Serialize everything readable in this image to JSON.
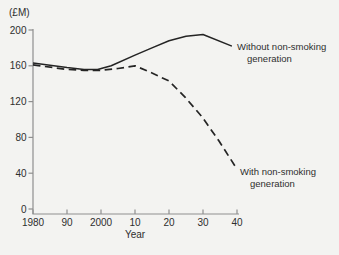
{
  "figure": {
    "background_color": "#f3f3f1",
    "axis_color": "#8f8f8f",
    "text_color": "#2e2e2e"
  },
  "chart_data": {
    "type": "line",
    "title": "",
    "ylabel": "(£M)",
    "xlabel": "Year",
    "grid": false,
    "legend": "inline-labels-at-line-ends",
    "x_axis": {
      "tick_labels": [
        "1980",
        "90",
        "2000",
        "10",
        "20",
        "30",
        "40"
      ],
      "tick_years": [
        1980,
        1990,
        2000,
        2010,
        2020,
        2030,
        2040
      ],
      "range_years": [
        1980,
        2040
      ]
    },
    "y_axis": {
      "ticks": [
        0,
        40,
        80,
        120,
        160,
        200
      ],
      "tick_labels": [
        "0",
        "40",
        "80",
        "120",
        "160",
        "200"
      ],
      "range": [
        0,
        200
      ]
    },
    "series": [
      {
        "name": "Without non-smoking generation",
        "label_lines": [
          "Without non-smoking",
          "generation"
        ],
        "style": "solid",
        "color": "#242424",
        "points": [
          [
            1980,
            163
          ],
          [
            1990,
            158
          ],
          [
            1995,
            156
          ],
          [
            1999,
            156
          ],
          [
            2003,
            160
          ],
          [
            2010,
            172
          ],
          [
            2015,
            180
          ],
          [
            2020,
            188
          ],
          [
            2025,
            193
          ],
          [
            2030,
            195
          ],
          [
            2038.5,
            182
          ]
        ]
      },
      {
        "name": "With non-smoking generation",
        "label_lines": [
          "With non-smoking",
          "generation"
        ],
        "style": "dashed",
        "color": "#242424",
        "points": [
          [
            1980,
            161
          ],
          [
            1990,
            156
          ],
          [
            1995,
            155
          ],
          [
            2000,
            155
          ],
          [
            2005,
            157
          ],
          [
            2010,
            160
          ],
          [
            2015,
            152
          ],
          [
            2020,
            143
          ],
          [
            2024.7,
            125
          ],
          [
            2029.7,
            103
          ],
          [
            2034.7,
            76
          ],
          [
            2039.4,
            48
          ]
        ]
      }
    ]
  }
}
